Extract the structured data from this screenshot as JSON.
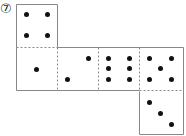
{
  "problem_label": "⑦",
  "net": {
    "description": "Dice net with six faces",
    "faces": [
      {
        "name": "top",
        "pips": 4
      },
      {
        "name": "row-1",
        "pips": 1
      },
      {
        "name": "row-2",
        "pips": 2
      },
      {
        "name": "row-3",
        "pips": 6
      },
      {
        "name": "row-4",
        "pips": 5
      },
      {
        "name": "bottom",
        "pips": 3
      }
    ]
  }
}
